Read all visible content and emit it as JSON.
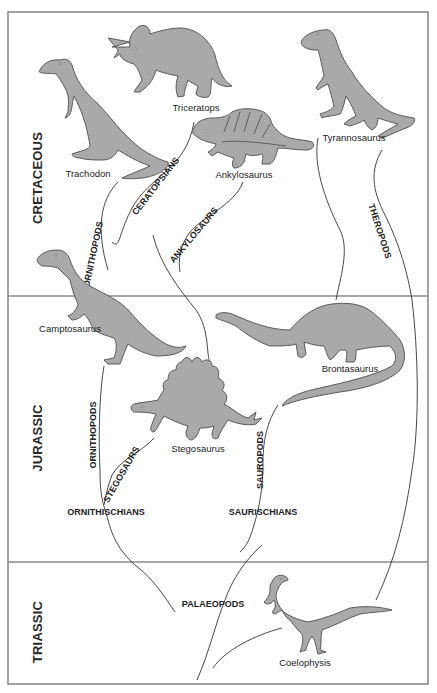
{
  "diagram": {
    "type": "evolutionary tree of dinosaurs",
    "periods": [
      {
        "id": "cretaceous",
        "label": "CRETACEOUS"
      },
      {
        "id": "jurassic",
        "label": "JURASSIC"
      },
      {
        "id": "triassic",
        "label": "TRIASSIC"
      }
    ],
    "dinosaurs": {
      "trachodon": "Trachodon",
      "triceratops": "Triceratops",
      "ankylosaurus": "Ankylosaurus",
      "tyrannosaurus": "Tyrannosaurus",
      "camptosaurus": "Camptosaurus",
      "brontasaurus": "Brontasaurus",
      "stegosaurus": "Stegosaurus",
      "coelophysis": "Coelophysis"
    },
    "groups": {
      "ornithopods_upper": "ORNITHOPODS",
      "ceratopsians": "CERATOPSIANS",
      "ankylosaurs": "ANKYLOSAURS",
      "theropods": "THEROPODS",
      "ornithopods_lower": "ORNITHOPODS",
      "stegosaurs": "STEGOSAURS",
      "sauropods": "SAUROPODS",
      "ornithischians": "ORNITHISCHIANS",
      "saurischians": "SAURISCHIANS",
      "palaeopods": "PALAEOPODS"
    },
    "colors": {
      "silhouette_fill": "#a9a9a9",
      "silhouette_outline": "#5a5a5a",
      "frame": "#8a8a8a",
      "lines": "#333333"
    }
  }
}
